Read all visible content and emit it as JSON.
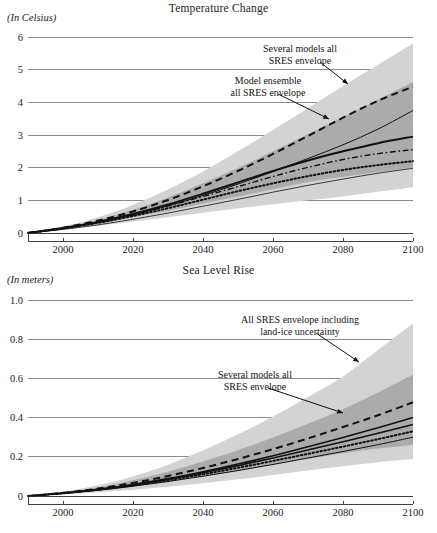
{
  "figure": {
    "width": 437,
    "height": 533,
    "background": "#ffffff",
    "ink_color": "#1c1c1c"
  },
  "colors": {
    "band_outer": "#d3d3d3",
    "band_inner": "#ababab",
    "line": "#111111",
    "grid": "#5a5a5a",
    "axis": "#2b2b2b"
  },
  "chart_data": [
    {
      "id": "temperature-change",
      "type": "area",
      "title": "Temperature Change",
      "ylabel": "(In Celsius)",
      "xlabel": "",
      "grid": true,
      "legend_position": "inline-annotations",
      "xlim": [
        1990,
        2100
      ],
      "ylim": [
        0,
        6
      ],
      "xticks": [
        2000,
        2020,
        2040,
        2060,
        2080,
        2100
      ],
      "xticklabels": [
        "2000",
        "2020",
        "2040",
        "2060",
        "2080",
        "2100"
      ],
      "yticks": [
        0,
        1,
        2,
        3,
        4,
        5,
        6
      ],
      "yticklabels": [
        "0",
        "1",
        "2",
        "3",
        "4",
        "5",
        "6"
      ],
      "x": [
        1990,
        2000,
        2010,
        2020,
        2030,
        2040,
        2050,
        2060,
        2070,
        2080,
        2090,
        2100
      ],
      "bands": [
        {
          "name": "Several models all SRES envelope",
          "fill": "#d3d3d3",
          "lower": [
            0.0,
            0.1,
            0.22,
            0.35,
            0.48,
            0.62,
            0.75,
            0.88,
            1.0,
            1.12,
            1.26,
            1.4
          ],
          "upper": [
            0.02,
            0.2,
            0.48,
            0.86,
            1.33,
            1.88,
            2.5,
            3.15,
            3.82,
            4.5,
            5.15,
            5.8
          ]
        },
        {
          "name": "Model ensemble all SRES envelope",
          "fill": "#ababab",
          "lower": [
            0.0,
            0.13,
            0.29,
            0.48,
            0.68,
            0.9,
            1.12,
            1.34,
            1.56,
            1.72,
            1.87,
            2.0
          ],
          "upper": [
            0.01,
            0.17,
            0.4,
            0.71,
            1.09,
            1.52,
            1.99,
            2.5,
            3.03,
            3.55,
            4.08,
            4.62
          ]
        }
      ],
      "series": [
        {
          "name": "A2 scenario",
          "style": "dashed",
          "width": 2.0,
          "values": [
            0.0,
            0.16,
            0.38,
            0.66,
            1.01,
            1.43,
            1.9,
            2.42,
            2.97,
            3.53,
            4.05,
            4.48
          ]
        },
        {
          "name": "A1B scenario",
          "style": "solid",
          "width": 2.0,
          "values": [
            0.0,
            0.15,
            0.34,
            0.58,
            0.87,
            1.2,
            1.55,
            1.9,
            2.22,
            2.5,
            2.75,
            2.95
          ]
        },
        {
          "name": "B2 scenario",
          "style": "solid",
          "width": 1.0,
          "values": [
            0.0,
            0.14,
            0.32,
            0.55,
            0.83,
            1.15,
            1.5,
            1.88,
            2.28,
            2.7,
            3.18,
            3.75
          ]
        },
        {
          "name": "B1 scenario",
          "style": "dotted",
          "width": 2.0,
          "values": [
            0.0,
            0.14,
            0.31,
            0.52,
            0.76,
            1.02,
            1.28,
            1.52,
            1.74,
            1.93,
            2.08,
            2.2
          ]
        },
        {
          "name": "IS92a scenario",
          "style": "dashdot",
          "width": 1.4,
          "values": [
            0.0,
            0.15,
            0.33,
            0.56,
            0.83,
            1.12,
            1.42,
            1.73,
            2.01,
            2.25,
            2.43,
            2.55
          ]
        },
        {
          "name": "Constant concentration",
          "style": "solid-thin",
          "width": 0.8,
          "values": [
            0.0,
            0.11,
            0.25,
            0.42,
            0.61,
            0.82,
            1.03,
            1.25,
            1.46,
            1.65,
            1.83,
            1.98
          ]
        }
      ],
      "annotations": [
        {
          "name": "several-models-annotation",
          "lines": [
            "Several models all",
            "SRES envelope"
          ],
          "text_x": 300,
          "text_y": 52,
          "anchor": "middle",
          "arrow_from": [
            320,
            62
          ],
          "arrow_to": [
            348,
            84
          ]
        },
        {
          "name": "model-ensemble-annotation",
          "lines": [
            "Model ensemble",
            "all SRES envelope"
          ],
          "text_x": 268,
          "text_y": 84,
          "anchor": "middle",
          "arrow_from": [
            278,
            94
          ],
          "arrow_to": [
            329,
            119
          ]
        }
      ]
    },
    {
      "id": "sea-level-rise",
      "type": "area",
      "title": "Sea Level Rise",
      "ylabel": "(In meters)",
      "xlabel": "",
      "grid": true,
      "legend_position": "inline-annotations",
      "xlim": [
        1990,
        2100
      ],
      "ylim": [
        0,
        1.0
      ],
      "xticks": [
        2000,
        2020,
        2040,
        2060,
        2080,
        2100
      ],
      "xticklabels": [
        "2000",
        "2020",
        "2040",
        "2060",
        "2080",
        "2100"
      ],
      "yticks": [
        0,
        0.2,
        0.4,
        0.6,
        0.8,
        1.0
      ],
      "yticklabels": [
        "0",
        "0.2",
        "0.4",
        "0.6",
        "0.8",
        "1.0"
      ],
      "x": [
        1990,
        2000,
        2010,
        2020,
        2030,
        2040,
        2050,
        2060,
        2070,
        2080,
        2090,
        2100
      ],
      "bands": [
        {
          "name": "All SRES envelope including land-ice uncertainty",
          "fill": "#d3d3d3",
          "lower": [
            0.0,
            0.008,
            0.019,
            0.032,
            0.047,
            0.065,
            0.085,
            0.107,
            0.13,
            0.152,
            0.172,
            0.19
          ],
          "upper": [
            0.002,
            0.022,
            0.055,
            0.1,
            0.16,
            0.232,
            0.315,
            0.405,
            0.505,
            0.61,
            0.745,
            0.88
          ]
        },
        {
          "name": "Several models all SRES envelope",
          "fill": "#ababab",
          "lower": [
            0.0,
            0.012,
            0.028,
            0.048,
            0.072,
            0.099,
            0.128,
            0.159,
            0.19,
            0.218,
            0.242,
            0.262
          ],
          "upper": [
            0.001,
            0.018,
            0.044,
            0.08,
            0.124,
            0.176,
            0.234,
            0.298,
            0.368,
            0.443,
            0.528,
            0.62
          ]
        }
      ],
      "series": [
        {
          "name": "A1FI scenario",
          "style": "dashed",
          "width": 2.0,
          "values": [
            0.0,
            0.016,
            0.038,
            0.067,
            0.102,
            0.143,
            0.189,
            0.239,
            0.294,
            0.352,
            0.412,
            0.478
          ]
        },
        {
          "name": "A2 scenario",
          "style": "solid",
          "width": 1.6,
          "values": [
            0.0,
            0.015,
            0.034,
            0.059,
            0.089,
            0.124,
            0.163,
            0.205,
            0.251,
            0.299,
            0.348,
            0.4
          ]
        },
        {
          "name": "A1B scenario",
          "style": "solid",
          "width": 1.6,
          "values": [
            0.0,
            0.014,
            0.033,
            0.057,
            0.086,
            0.119,
            0.155,
            0.194,
            0.235,
            0.277,
            0.32,
            0.365
          ]
        },
        {
          "name": "B1 scenario",
          "style": "dotted",
          "width": 2.0,
          "values": [
            0.0,
            0.014,
            0.032,
            0.054,
            0.081,
            0.111,
            0.144,
            0.179,
            0.215,
            0.252,
            0.29,
            0.33
          ]
        },
        {
          "name": "B2 scenario",
          "style": "solid-thin",
          "width": 1.0,
          "values": [
            0.0,
            0.013,
            0.029,
            0.05,
            0.074,
            0.101,
            0.13,
            0.161,
            0.194,
            0.227,
            0.262,
            0.3
          ]
        }
      ],
      "annotations": [
        {
          "name": "all-sres-landice-annotation",
          "lines": [
            "All SRES envelope including",
            "land-ice uncertainty"
          ],
          "text_x": 300,
          "text_y": 61,
          "anchor": "middle",
          "arrow_from": [
            316,
            71
          ],
          "arrow_to": [
            359,
            100
          ]
        },
        {
          "name": "several-models-annotation",
          "lines": [
            "Several models all",
            "SRES envelope"
          ],
          "text_x": 255,
          "text_y": 116,
          "anchor": "middle",
          "arrow_from": [
            268,
            126
          ],
          "arrow_to": [
            343,
            151
          ]
        }
      ]
    }
  ]
}
